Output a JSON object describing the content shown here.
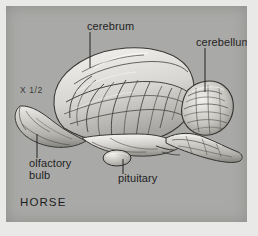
{
  "figure": {
    "subject": "HORSE",
    "scale_marker": "X 1/2",
    "caption": "HORSE",
    "panel_color": "#a9a9a7",
    "background_color": "#e9e9e7",
    "ink_color": "#232323"
  },
  "labels": {
    "cerebrum": "cerebrum",
    "cerebellum": "cerebellum",
    "olfactory_bulb_line1": "olfactory",
    "olfactory_bulb_line2": "bulb",
    "pituitary": "pituitary"
  },
  "structures": [
    {
      "name": "cerebrum",
      "label": "cerebrum"
    },
    {
      "name": "cerebellum",
      "label": "cerebellum"
    },
    {
      "name": "olfactory-bulb",
      "label": "olfactory bulb"
    },
    {
      "name": "pituitary",
      "label": "pituitary"
    },
    {
      "name": "brainstem",
      "label": ""
    }
  ]
}
